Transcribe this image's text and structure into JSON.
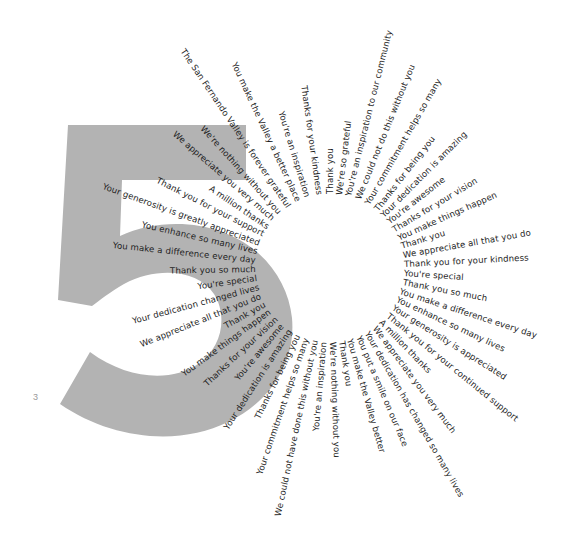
{
  "graphic": {
    "big_numeral": "5",
    "numeral_color": "#b3b3b3",
    "text_color": "#1e1e1e",
    "page_number": "3"
  },
  "burst": {
    "center": [
      330,
      268
    ],
    "inner_radius": 74,
    "phrases": [
      {
        "text": "Thank you",
        "angle": -90
      },
      {
        "text": "We're so grateful",
        "angle": -83
      },
      {
        "text": "You're an inspiration to our community",
        "angle": -76
      },
      {
        "text": "We could not do this without you",
        "angle": -68
      },
      {
        "text": "Your commitment helps so many",
        "angle": -60
      },
      {
        "text": "Thanks for being you",
        "angle": -52
      },
      {
        "text": "Your dedication is amazing",
        "angle": -45
      },
      {
        "text": "You're awesome",
        "angle": -38
      },
      {
        "text": "Thanks for your vision",
        "angle": -31
      },
      {
        "text": "You make things happen",
        "angle": -24
      },
      {
        "text": "Thank you",
        "angle": -17
      },
      {
        "text": "We appreciate all that you do",
        "angle": -10
      },
      {
        "text": "Thank you for your kindness",
        "angle": -3
      },
      {
        "text": "You're special",
        "angle": 4
      },
      {
        "text": "Thank you so much",
        "angle": 11
      },
      {
        "text": "You make a difference every day",
        "angle": 18
      },
      {
        "text": "You enhance so many lives",
        "angle": 25
      },
      {
        "text": "Your generosity is appreciated",
        "angle": 32
      },
      {
        "text": "Thank you for your continued support",
        "angle": 39
      },
      {
        "text": "A million thanks",
        "angle": 46
      },
      {
        "text": "We appreciate you very much",
        "angle": 53
      },
      {
        "text": "Your dedication has changed so many lives",
        "angle": 60
      },
      {
        "text": "You put a smile on our face",
        "angle": 67
      },
      {
        "text": "You make the Valley better",
        "angle": 74
      },
      {
        "text": "Thank you",
        "angle": 81
      },
      {
        "text": "We're nothing without you",
        "angle": 88
      },
      {
        "text": "You're an inspiration",
        "angle": 95
      },
      {
        "text": "We could not have done this without you",
        "angle": 102
      },
      {
        "text": "Your commitment helps so many",
        "angle": 109
      },
      {
        "text": "Thanks for being you",
        "angle": 116
      },
      {
        "text": "Your dedication is amazing",
        "angle": 123
      },
      {
        "text": "You're awesome",
        "angle": 130
      },
      {
        "text": "Thanks for your vision",
        "angle": 137
      },
      {
        "text": "You make things happen",
        "angle": 144
      },
      {
        "text": "Thank you",
        "angle": 151
      },
      {
        "text": "We appreciate all that you do",
        "angle": 158
      },
      {
        "text": "Your dedication changed lives",
        "angle": 165
      },
      {
        "text": "You're special",
        "angle": 172
      },
      {
        "text": "Thank you so much",
        "angle": 179
      },
      {
        "text": "You make a difference every day",
        "angle": 186
      },
      {
        "text": "You enhance so many lives",
        "angle": 193
      },
      {
        "text": "Your generosity is greatly appreciated",
        "angle": 200
      },
      {
        "text": "Thank you for your support",
        "angle": 207
      },
      {
        "text": "A million thanks",
        "angle": 214
      },
      {
        "text": "We appreciate you very much",
        "angle": 221
      },
      {
        "text": "We're nothing without you",
        "angle": 228
      },
      {
        "text": "The San Fernando Valley is forever grateful",
        "angle": 236
      },
      {
        "text": "You make the Valley a better place",
        "angle": 245
      },
      {
        "text": "You're an inspiration",
        "angle": 253
      },
      {
        "text": "Thanks for your kindness",
        "angle": 262
      }
    ]
  }
}
